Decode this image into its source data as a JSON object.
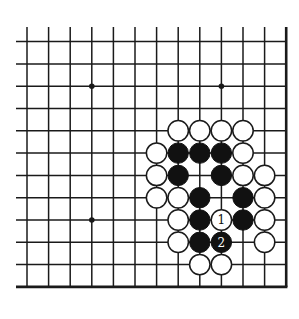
{
  "board": {
    "columns": 13,
    "rows": 12,
    "edges": [
      "right",
      "bottom"
    ],
    "line_color": "#1a1a1a",
    "background": "#ffffff",
    "star_points": [
      {
        "col": 3,
        "row": 2
      },
      {
        "col": 9,
        "row": 2
      },
      {
        "col": 3,
        "row": 8
      }
    ],
    "stones": [
      {
        "col": 7,
        "row": 4,
        "color": "white"
      },
      {
        "col": 8,
        "row": 4,
        "color": "white"
      },
      {
        "col": 9,
        "row": 4,
        "color": "white"
      },
      {
        "col": 10,
        "row": 4,
        "color": "white"
      },
      {
        "col": 6,
        "row": 5,
        "color": "white"
      },
      {
        "col": 7,
        "row": 5,
        "color": "black"
      },
      {
        "col": 8,
        "row": 5,
        "color": "black"
      },
      {
        "col": 9,
        "row": 5,
        "color": "black"
      },
      {
        "col": 10,
        "row": 5,
        "color": "white"
      },
      {
        "col": 6,
        "row": 6,
        "color": "white"
      },
      {
        "col": 7,
        "row": 6,
        "color": "black"
      },
      {
        "col": 9,
        "row": 6,
        "color": "black"
      },
      {
        "col": 10,
        "row": 6,
        "color": "white"
      },
      {
        "col": 11,
        "row": 6,
        "color": "white"
      },
      {
        "col": 6,
        "row": 7,
        "color": "white"
      },
      {
        "col": 7,
        "row": 7,
        "color": "white"
      },
      {
        "col": 8,
        "row": 7,
        "color": "black"
      },
      {
        "col": 10,
        "row": 7,
        "color": "black"
      },
      {
        "col": 11,
        "row": 7,
        "color": "white"
      },
      {
        "col": 7,
        "row": 8,
        "color": "white"
      },
      {
        "col": 8,
        "row": 8,
        "color": "black"
      },
      {
        "col": 9,
        "row": 8,
        "color": "white",
        "label": "1"
      },
      {
        "col": 10,
        "row": 8,
        "color": "black"
      },
      {
        "col": 11,
        "row": 8,
        "color": "white"
      },
      {
        "col": 7,
        "row": 9,
        "color": "white"
      },
      {
        "col": 8,
        "row": 9,
        "color": "black"
      },
      {
        "col": 9,
        "row": 9,
        "color": "black",
        "label": "2"
      },
      {
        "col": 11,
        "row": 9,
        "color": "white"
      },
      {
        "col": 8,
        "row": 10,
        "color": "white"
      },
      {
        "col": 9,
        "row": 10,
        "color": "white"
      }
    ]
  }
}
